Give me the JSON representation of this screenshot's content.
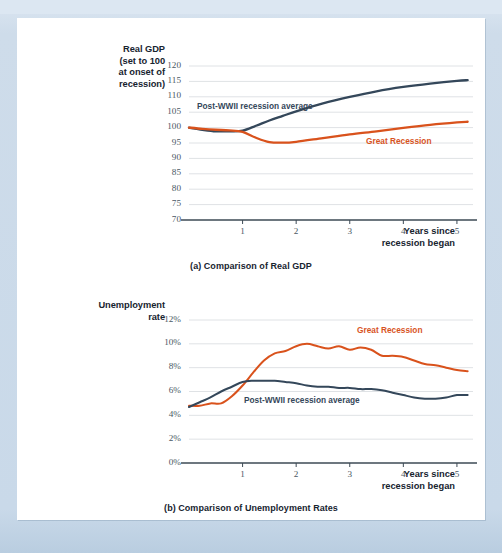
{
  "figure": {
    "background_color": "#cedcea",
    "card_color": "#ffffff"
  },
  "colors": {
    "great_recession": "#d9521c",
    "postwwii_average": "#34475a",
    "gridline": "#dfe2e5",
    "axis": "#3d4a55",
    "tick_text": "#4a5864"
  },
  "panels": [
    {
      "id": "gdp",
      "caption": "(a) Comparison of Real GDP",
      "y_axis_title": "Real GDP (set to 100 at onset of recession)",
      "y_axis_title_lines": [
        "Real GDP",
        "(set to 100",
        "at onset of",
        "recession)"
      ],
      "x_axis_title_lines": [
        "Years since",
        "recession began"
      ],
      "series_labels": [
        {
          "text": "Post-WWII recession average",
          "color": "#34475a"
        },
        {
          "text": "Great Recession",
          "color": "#d9521c"
        }
      ]
    },
    {
      "id": "unemployment",
      "caption": "(b) Comparison of Unemployment Rates",
      "y_axis_title": "Unemployment rate",
      "y_axis_title_lines": [
        "Unemployment",
        "rate"
      ],
      "x_axis_title_lines": [
        "Years since",
        "recession began"
      ],
      "series_labels": [
        {
          "text": "Great Recession",
          "color": "#d9521c"
        },
        {
          "text": "Post-WWII recession average",
          "color": "#34475a"
        }
      ]
    }
  ],
  "chart_data": [
    {
      "type": "line",
      "title": "(a) Comparison of Real GDP",
      "xlabel": "Years since recession began",
      "ylabel": "Real GDP (set to 100 at onset of recession)",
      "xlim": [
        0,
        5.3
      ],
      "ylim": [
        70,
        120
      ],
      "yticks": [
        70,
        75,
        80,
        85,
        90,
        95,
        100,
        105,
        110,
        115,
        120
      ],
      "ytick_labels": [
        "70",
        "75",
        "80",
        "85",
        "90",
        "95",
        "100",
        "105",
        "110",
        "115",
        "120"
      ],
      "xticks": [
        1,
        2,
        3,
        4,
        5
      ],
      "xtick_labels": [
        "1",
        "2",
        "3",
        "4",
        "5"
      ],
      "grid": "horizontal",
      "legend": "inline-annotations",
      "series": [
        {
          "name": "Post-WWII recession average",
          "color": "#34475a",
          "x": [
            0,
            0.25,
            0.5,
            0.75,
            1.0,
            1.25,
            1.5,
            1.75,
            2.0,
            2.5,
            3.0,
            3.5,
            4.0,
            4.5,
            5.0,
            5.2
          ],
          "values": [
            100.0,
            99.3,
            98.8,
            98.8,
            99.0,
            100.6,
            102.3,
            103.8,
            105.3,
            107.9,
            110.0,
            111.8,
            113.2,
            114.3,
            115.2,
            115.4
          ]
        },
        {
          "name": "Great Recession",
          "color": "#d9521c",
          "x": [
            0,
            0.25,
            0.5,
            0.75,
            1.0,
            1.25,
            1.5,
            1.75,
            2.0,
            2.5,
            3.0,
            3.5,
            4.0,
            4.5,
            5.0,
            5.2
          ],
          "values": [
            100.0,
            99.6,
            99.3,
            99.1,
            98.6,
            96.7,
            95.3,
            95.1,
            95.4,
            96.6,
            97.8,
            98.8,
            99.9,
            100.9,
            101.7,
            101.9
          ]
        }
      ]
    },
    {
      "type": "line",
      "title": "(b) Comparison of Unemployment Rates",
      "xlabel": "Years since recession began",
      "ylabel": "Unemployment rate",
      "xlim": [
        0,
        5.3
      ],
      "ylim": [
        0,
        12
      ],
      "yticks": [
        0,
        2,
        4,
        6,
        8,
        10,
        12
      ],
      "ytick_labels": [
        "0%",
        "2%",
        "4%",
        "6%",
        "8%",
        "10%",
        "12%"
      ],
      "xticks": [
        1,
        2,
        3,
        4,
        5
      ],
      "xtick_labels": [
        "1",
        "2",
        "3",
        "4",
        "5"
      ],
      "grid": "horizontal",
      "legend": "inline-annotations",
      "series": [
        {
          "name": "Great Recession",
          "color": "#d9521c",
          "x": [
            0,
            0.2,
            0.4,
            0.6,
            0.8,
            1.0,
            1.2,
            1.4,
            1.6,
            1.8,
            2.0,
            2.2,
            2.4,
            2.6,
            2.8,
            3.0,
            3.2,
            3.4,
            3.6,
            3.8,
            4.0,
            4.2,
            4.4,
            4.6,
            4.8,
            5.0,
            5.2
          ],
          "values": [
            4.8,
            4.8,
            5.0,
            5.0,
            5.6,
            6.5,
            7.6,
            8.6,
            9.2,
            9.4,
            9.8,
            10.0,
            9.8,
            9.6,
            9.8,
            9.5,
            9.7,
            9.5,
            9.0,
            9.0,
            8.9,
            8.6,
            8.3,
            8.2,
            8.0,
            7.8,
            7.7
          ]
        },
        {
          "name": "Post-WWII recession average",
          "color": "#34475a",
          "x": [
            0,
            0.2,
            0.4,
            0.6,
            0.8,
            1.0,
            1.2,
            1.4,
            1.6,
            1.8,
            2.0,
            2.2,
            2.4,
            2.6,
            2.8,
            3.0,
            3.2,
            3.4,
            3.6,
            3.8,
            4.0,
            4.2,
            4.4,
            4.6,
            4.8,
            5.0,
            5.2
          ],
          "values": [
            4.7,
            5.1,
            5.5,
            6.0,
            6.4,
            6.8,
            6.9,
            6.9,
            6.9,
            6.8,
            6.7,
            6.5,
            6.4,
            6.4,
            6.3,
            6.3,
            6.2,
            6.2,
            6.1,
            5.9,
            5.7,
            5.5,
            5.4,
            5.4,
            5.5,
            5.7,
            5.7
          ]
        }
      ]
    }
  ]
}
